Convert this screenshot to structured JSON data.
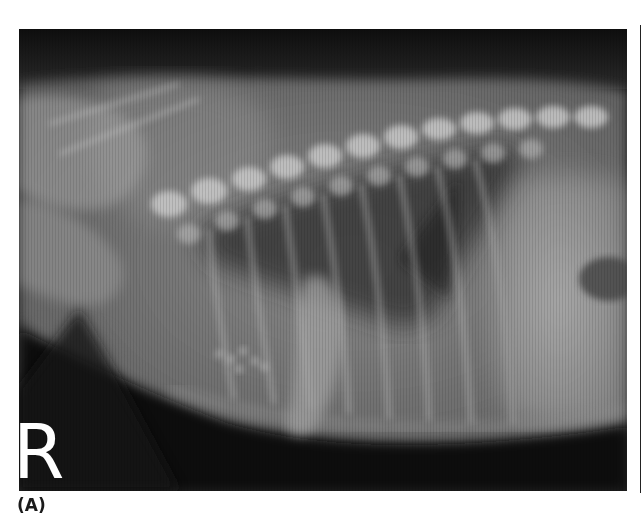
{
  "figure": {
    "panel_label": "(A)",
    "image": {
      "type": "lateral thoracic radiograph",
      "side_marker": "R",
      "colors": {
        "background_dark": "#141414",
        "soft_tissue": "#7a7a7a",
        "bone": "#d2d2d2",
        "lung_dark": "#3c3c3c"
      }
    }
  }
}
